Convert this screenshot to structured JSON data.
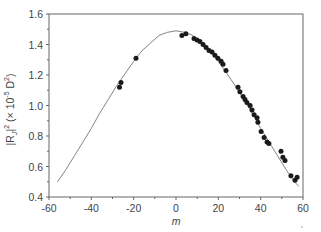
{
  "chart_data": {
    "type": "scatter",
    "title": "",
    "xlabel": "m",
    "ylabel": "|R_J|^2 (× 10^-5 D^2)",
    "ylabel_parts": {
      "main": "|R",
      "sub": "J",
      "close": "|",
      "sup1": "2",
      "paren_open": " (× 10",
      "sup2": "-5",
      "unit": " D",
      "sup3": "2",
      "paren_close": ")"
    },
    "xlim": [
      -60,
      60
    ],
    "ylim": [
      0.4,
      1.6
    ],
    "xticks": [
      -60,
      -40,
      -20,
      0,
      20,
      40,
      60
    ],
    "yticks": [
      0.4,
      0.6,
      0.8,
      1.0,
      1.2,
      1.4,
      1.6
    ],
    "ytick_labels": [
      "0.4",
      "0.6",
      "0.8",
      "1.0",
      "1.2",
      "1.4",
      "1.6"
    ],
    "grid": false,
    "legend": null,
    "series": [
      {
        "name": "measured",
        "type": "scatter",
        "x": [
          -26.7,
          -26.0,
          -18.9,
          2.8,
          4.7,
          8.5,
          9.9,
          11.3,
          12.8,
          14.2,
          15.6,
          17.0,
          18.4,
          19.8,
          21.3,
          22.2,
          23.6,
          29.3,
          30.2,
          31.7,
          32.6,
          33.5,
          35.0,
          35.9,
          36.9,
          38.3,
          38.7,
          40.2,
          41.6,
          43.0,
          43.9,
          49.6,
          50.5,
          51.5,
          54.3,
          56.2,
          57.2
        ],
        "y": [
          1.12,
          1.15,
          1.31,
          1.46,
          1.47,
          1.44,
          1.43,
          1.42,
          1.4,
          1.38,
          1.36,
          1.35,
          1.33,
          1.31,
          1.29,
          1.27,
          1.23,
          1.12,
          1.09,
          1.06,
          1.04,
          1.02,
          1.0,
          0.97,
          0.94,
          0.92,
          0.89,
          0.83,
          0.79,
          0.76,
          0.75,
          0.7,
          0.66,
          0.64,
          0.54,
          0.51,
          0.53
        ]
      },
      {
        "name": "calculated",
        "type": "line",
        "x": [
          -56,
          -52,
          -48,
          -44,
          -40,
          -36,
          -32,
          -28,
          -24,
          -20,
          -16,
          -12,
          -8,
          -4,
          0,
          4,
          8,
          12,
          16,
          20,
          24,
          28,
          32,
          36,
          40,
          44,
          48,
          52,
          56,
          58
        ],
        "y": [
          0.5,
          0.58,
          0.67,
          0.76,
          0.85,
          0.95,
          1.04,
          1.13,
          1.21,
          1.29,
          1.36,
          1.41,
          1.46,
          1.48,
          1.49,
          1.48,
          1.46,
          1.41,
          1.36,
          1.29,
          1.21,
          1.13,
          1.04,
          0.95,
          0.85,
          0.76,
          0.67,
          0.58,
          0.5,
          0.47
        ]
      }
    ]
  },
  "colors": {
    "axis": "#555555",
    "marker": "#1a1a1a",
    "curve": "#777777"
  }
}
